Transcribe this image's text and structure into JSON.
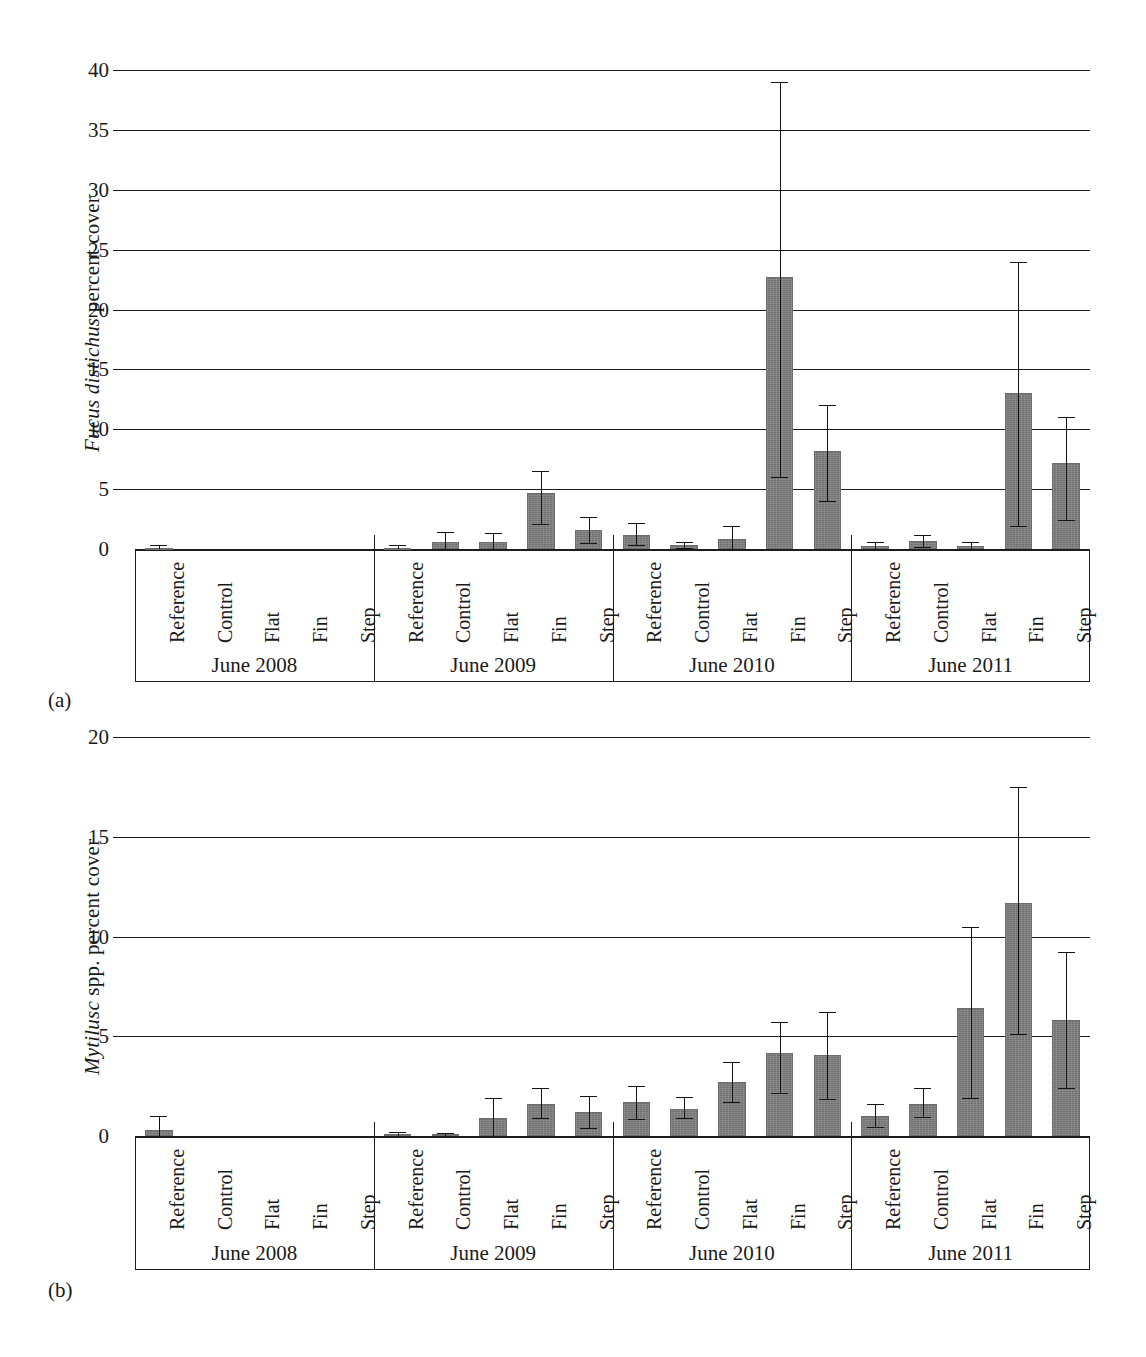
{
  "figure": {
    "panels": [
      {
        "letter": "(a)"
      },
      {
        "letter": "(b)"
      }
    ]
  },
  "chart_data": [
    {
      "type": "bar",
      "panel": "(a)",
      "title": "",
      "ylabel_italic": "Fucus distichus",
      "ylabel_rest": " percent cover",
      "ylabel": "Fucus distichus percent cover",
      "xlabel": "",
      "ylim": [
        0,
        40
      ],
      "yticks": [
        0,
        5,
        10,
        15,
        20,
        25,
        30,
        35,
        40
      ],
      "grid": true,
      "legend": "none",
      "groups": [
        "June 2008",
        "June 2009",
        "June 2010",
        "June 2011"
      ],
      "categories": [
        "Reference",
        "Control",
        "Flat",
        "Fin",
        "Step"
      ],
      "series": [
        {
          "name": "June 2008",
          "values": [
            0.05,
            0,
            0,
            0,
            0
          ],
          "err_low": [
            0.0,
            0,
            0,
            0,
            0
          ],
          "err_high": [
            0.3,
            0,
            0,
            0,
            0
          ]
        },
        {
          "name": "June 2009",
          "values": [
            0.1,
            0.6,
            0.55,
            4.7,
            1.6
          ],
          "err_low": [
            0.0,
            0.0,
            0.0,
            2.1,
            0.5
          ],
          "err_high": [
            0.35,
            1.4,
            1.35,
            6.5,
            2.7
          ]
        },
        {
          "name": "June 2010",
          "values": [
            1.2,
            0.35,
            0.85,
            22.7,
            8.2
          ],
          "err_low": [
            0.3,
            0.1,
            0.0,
            6.0,
            4.0
          ],
          "err_high": [
            2.2,
            0.6,
            1.9,
            39.0,
            12.0
          ]
        },
        {
          "name": "June 2011",
          "values": [
            0.25,
            0.7,
            0.25,
            13.0,
            7.2
          ],
          "err_low": [
            0.0,
            0.2,
            0.0,
            1.9,
            2.4
          ],
          "err_high": [
            0.6,
            1.2,
            0.55,
            24.0,
            11.0
          ]
        }
      ]
    },
    {
      "type": "bar",
      "panel": "(b)",
      "title": "",
      "ylabel_italic": "Mytilusc",
      "ylabel_rest": " spp. percent cover",
      "ylabel": "Mytilusc spp. percent cover",
      "xlabel": "",
      "ylim": [
        0,
        20
      ],
      "yticks": [
        0,
        5,
        10,
        15,
        20
      ],
      "grid": true,
      "legend": "none",
      "groups": [
        "June 2008",
        "June 2009",
        "June 2010",
        "June 2011"
      ],
      "categories": [
        "Reference",
        "Control",
        "Flat",
        "Fin",
        "Step"
      ],
      "series": [
        {
          "name": "June 2008",
          "values": [
            0.3,
            0,
            0,
            0,
            0
          ],
          "err_low": [
            0.0,
            0,
            0,
            0,
            0
          ],
          "err_high": [
            1.0,
            0,
            0,
            0,
            0
          ]
        },
        {
          "name": "June 2009",
          "values": [
            0.12,
            0.1,
            0.9,
            1.6,
            1.2
          ],
          "err_low": [
            0.0,
            0.0,
            0.0,
            0.9,
            0.4
          ],
          "err_high": [
            0.2,
            0.15,
            1.9,
            2.4,
            2.0
          ]
        },
        {
          "name": "June 2010",
          "values": [
            1.7,
            1.35,
            2.7,
            4.15,
            4.05
          ],
          "err_low": [
            0.85,
            0.9,
            1.7,
            2.15,
            1.85
          ],
          "err_high": [
            2.5,
            1.95,
            3.7,
            5.7,
            6.2
          ]
        },
        {
          "name": "June 2011",
          "values": [
            1.0,
            1.6,
            6.4,
            11.7,
            5.8
          ],
          "err_low": [
            0.45,
            0.95,
            1.9,
            5.1,
            2.4
          ],
          "err_high": [
            1.6,
            2.4,
            10.5,
            17.5,
            9.2
          ]
        }
      ]
    }
  ]
}
